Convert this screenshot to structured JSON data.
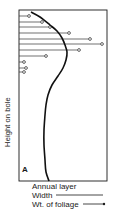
{
  "chart_data": {
    "type": "line",
    "title": "",
    "panel_label": "A",
    "ylabel": "Height on bole",
    "xlabel": "",
    "grid": false,
    "legend_position": "below",
    "legend": {
      "title": "Annual layer",
      "entries": [
        {
          "label": "Width",
          "style": "solid line"
        },
        {
          "label": "Wt. of foliage",
          "style": "line with open circle marker"
        }
      ]
    },
    "series": [
      {
        "name": "Width",
        "description": "Annual ring width vs height on bole; narrow near top, widest just below crown, near-constant lower bole",
        "points_px": [
          [
            31,
            12
          ],
          [
            40,
            17
          ],
          [
            50,
            25
          ],
          [
            57,
            31
          ],
          [
            62,
            38
          ],
          [
            65,
            45
          ],
          [
            67,
            52
          ],
          [
            66,
            60
          ],
          [
            63,
            68
          ],
          [
            58,
            76
          ],
          [
            52,
            85
          ],
          [
            48,
            95
          ],
          [
            46,
            105
          ],
          [
            45,
            115
          ],
          [
            44,
            130
          ],
          [
            44,
            145
          ],
          [
            45,
            160
          ],
          [
            46,
            172
          ],
          [
            49,
            181
          ]
        ]
      },
      {
        "name": "Wt. of foliage",
        "description": "Horizontal bars (foliage weight per whorl) ending in open circles",
        "heights_px": [
          16,
          22,
          27,
          33,
          39,
          44,
          50,
          56,
          62,
          68,
          72
        ],
        "values_px": [
          29,
          42,
          50,
          69,
          90,
          102,
          79,
          46,
          24,
          26,
          24
        ]
      }
    ],
    "frame_px": {
      "left": 19,
      "top": 10,
      "right": 107,
      "bottom": 181
    }
  }
}
